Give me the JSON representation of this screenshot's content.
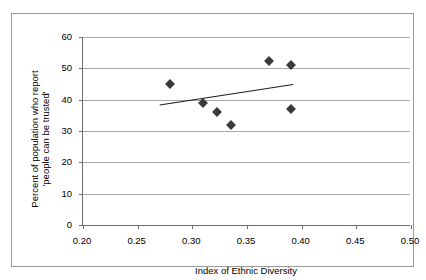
{
  "chart_data": {
    "type": "scatter",
    "title": "",
    "xlabel": "Index of Ethnic Diversity",
    "ylabel": "Percent of population who report\n'people can be trusted'",
    "xlim": [
      0.2,
      0.5
    ],
    "ylim": [
      0,
      60
    ],
    "xticks": [
      "0.20",
      "0.25",
      "0.30",
      "0.35",
      "0.40",
      "0.45",
      "0.50"
    ],
    "xtick_values": [
      0.2,
      0.25,
      0.3,
      0.35,
      0.4,
      0.45,
      0.5
    ],
    "yticks": [
      "0",
      "10",
      "20",
      "30",
      "40",
      "50",
      "60"
    ],
    "ytick_values": [
      0,
      10,
      20,
      30,
      40,
      50,
      60
    ],
    "grid": "horizontal",
    "legend": "none",
    "marker_style": "filled-diamond",
    "marker_color": "#3a3a3a",
    "points": [
      {
        "x": 0.28,
        "y": 45.0
      },
      {
        "x": 0.31,
        "y": 39.0
      },
      {
        "x": 0.323,
        "y": 36.0
      },
      {
        "x": 0.335,
        "y": 32.0
      },
      {
        "x": 0.37,
        "y": 52.5
      },
      {
        "x": 0.39,
        "y": 51.0
      },
      {
        "x": 0.39,
        "y": 37.0
      }
    ],
    "trendline": {
      "type": "linear",
      "x_start": 0.272,
      "y_start": 38.0,
      "x_end": 0.394,
      "y_end": 44.5,
      "color": "#1c1c1c"
    },
    "annotations": []
  },
  "axis": {
    "y_title_line1": "Percent of population who report",
    "y_title_line2": "'people can be trusted'",
    "x_title": "Index of Ethnic Diversity"
  }
}
